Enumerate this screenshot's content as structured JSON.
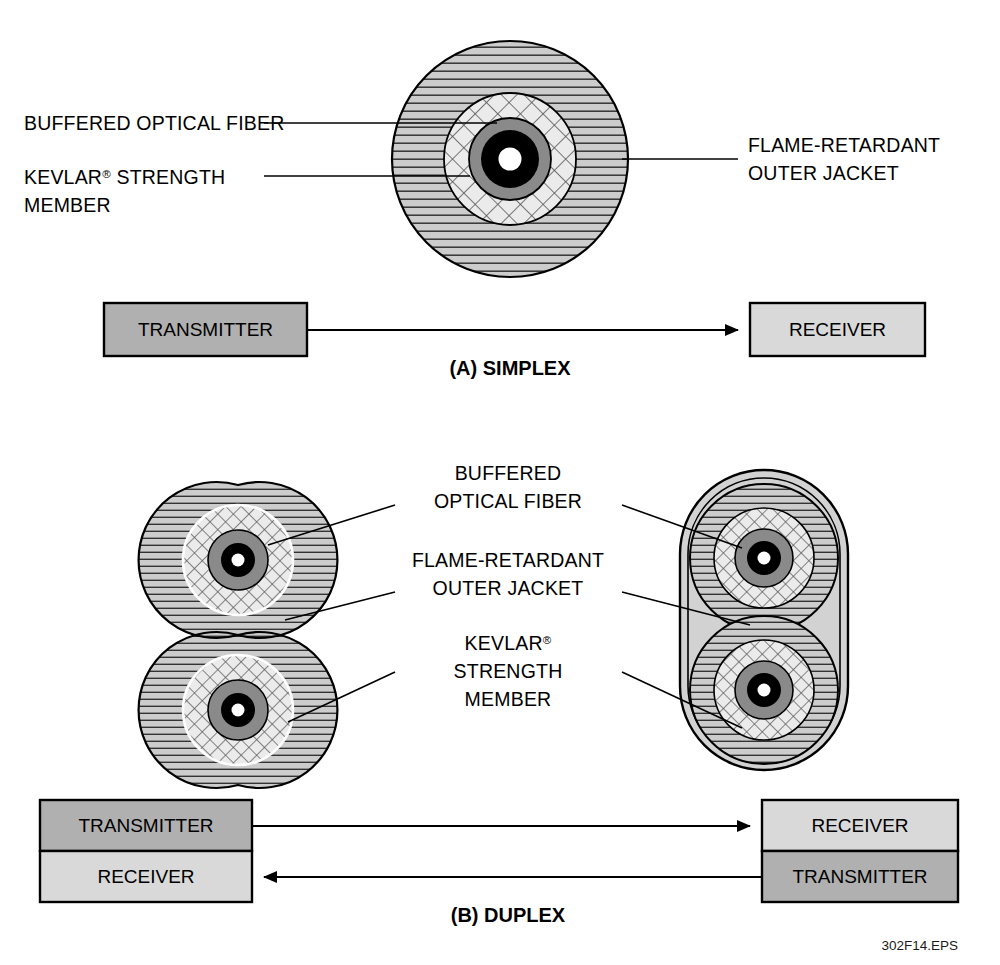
{
  "figure": {
    "id": "302F14.EPS",
    "panels": [
      {
        "caption": "(A) SIMPLEX",
        "labels": {
          "buffered_fiber": "BUFFERED OPTICAL FIBER",
          "kevlar_line1": "KEVLAR",
          "kevlar_sup": "®",
          "kevlar_line2": " STRENGTH",
          "kevlar_line3": "MEMBER",
          "jacket_line1": "FLAME-RETARDANT",
          "jacket_line2": "OUTER JACKET"
        },
        "link": {
          "source": "TRANSMITTER",
          "destination": "RECEIVER"
        }
      },
      {
        "caption": "(B) DUPLEX",
        "labels": {
          "buffered_line1": "BUFFERED",
          "buffered_line2": "OPTICAL FIBER",
          "jacket_line1": "FLAME-RETARDANT",
          "jacket_line2": "OUTER JACKET",
          "kevlar_line1": "KEVLAR",
          "kevlar_sup": "®",
          "kevlar_line2": "STRENGTH",
          "kevlar_line3": "MEMBER"
        },
        "link": {
          "left_top": "TRANSMITTER",
          "left_bottom": "RECEIVER",
          "right_top": "RECEIVER",
          "right_bottom": "TRANSMITTER"
        }
      }
    ],
    "colors": {
      "jacket_fill": "#cccccc",
      "hatch_line": "#333333",
      "kevlar_fill": "#ebebeb",
      "buffer_fill": "#8a8a8a",
      "cladding_fill": "#000000",
      "core_fill": "#ffffff",
      "transmitter_fill": "#b0b0b0",
      "receiver_fill": "#d9d9d9",
      "outline": "#000000"
    }
  }
}
